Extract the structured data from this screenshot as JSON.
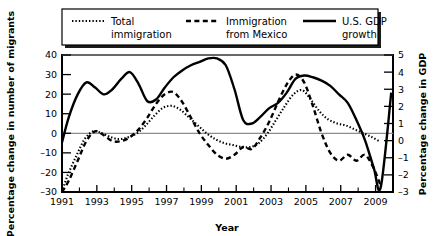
{
  "chart_data": {
    "type": "line",
    "title": "",
    "xlabel": "Year",
    "ylabel": "Percentage change in number of migrants",
    "y2label": "Percentage change in GDP",
    "ylim": [
      -30,
      40
    ],
    "y2lim": [
      -3,
      5
    ],
    "xlim": [
      1991,
      2010
    ],
    "grid": false,
    "zero_line": true,
    "legend_position": "top",
    "x_tick_labels": [
      "1991",
      "1993",
      "1995",
      "1997",
      "1999",
      "2001",
      "2003",
      "2005",
      "2007",
      "2009"
    ],
    "x_tick_values": [
      1991,
      1993,
      1995,
      1997,
      1999,
      2001,
      2003,
      2005,
      2007,
      2009
    ],
    "x_minor_ticks": [
      1992,
      1994,
      1996,
      1998,
      2000,
      2002,
      2004,
      2006,
      2008,
      2010
    ],
    "y_tick_labels": [
      "40",
      "30",
      "20",
      "10",
      "0",
      "-10",
      "-20",
      "-30"
    ],
    "y_tick_values": [
      40,
      30,
      20,
      10,
      0,
      -10,
      -20,
      -30
    ],
    "y2_tick_labels": [
      "5",
      "4",
      "3",
      "2",
      "1",
      "0",
      "-1",
      "-2",
      "-3"
    ],
    "y2_tick_values": [
      5,
      4,
      3,
      2,
      1,
      0,
      -1,
      -2,
      -3
    ],
    "series": [
      {
        "name": "Total immigration",
        "legend_label_line1": "Total",
        "legend_label_line2": "immigration",
        "style": "dotted",
        "axis": "left",
        "color": "#000000",
        "x": [
          1991.0,
          1991.3,
          1991.8,
          1992.3,
          1992.8,
          1993.3,
          1993.8,
          1994.3,
          1994.8,
          1995.3,
          1995.8,
          1996.3,
          1996.8,
          1997.3,
          1997.8,
          1998.3,
          1998.8,
          1999.3,
          1999.8,
          2000.3,
          2000.8,
          2001.3,
          2001.8,
          2002.3,
          2002.8,
          2003.3,
          2003.8,
          2004.3,
          2004.8,
          2005.3,
          2005.8,
          2006.3,
          2006.8,
          2007.3,
          2007.8,
          2008.3,
          2008.8,
          2009.2
        ],
        "values": [
          -30,
          -22,
          -12,
          -3,
          1,
          0,
          -2,
          -3,
          -2,
          0,
          4,
          9,
          13,
          14,
          12,
          8,
          4,
          0,
          -3,
          -5,
          -6,
          -7,
          -7,
          -5,
          0,
          7,
          14,
          20,
          22,
          17,
          11,
          7,
          5,
          4,
          2,
          0,
          -2,
          -4
        ]
      },
      {
        "name": "Immigration from Mexico",
        "legend_label_line1": "Immigration",
        "legend_label_line2": "from Mexico",
        "style": "dashed",
        "axis": "left",
        "color": "#000000",
        "x": [
          1991.0,
          1991.4,
          1991.9,
          1992.4,
          1992.9,
          1993.4,
          1993.9,
          1994.4,
          1994.9,
          1995.4,
          1995.9,
          1996.4,
          1996.9,
          1997.4,
          1997.9,
          1998.4,
          1998.9,
          1999.4,
          1999.9,
          2000.4,
          2000.9,
          2001.4,
          2001.9,
          2002.4,
          2002.9,
          2003.4,
          2003.9,
          2004.4,
          2004.9,
          2005.4,
          2005.9,
          2006.4,
          2006.9,
          2007.4,
          2007.9,
          2008.4,
          2008.9,
          2009.3
        ],
        "values": [
          -30,
          -24,
          -14,
          -4,
          1,
          -1,
          -4,
          -4,
          -2,
          2,
          8,
          15,
          20,
          21,
          16,
          8,
          0,
          -6,
          -11,
          -13,
          -11,
          -7,
          -8,
          -2,
          6,
          16,
          25,
          30,
          26,
          14,
          0,
          -10,
          -14,
          -11,
          -14,
          -11,
          -18,
          -27
        ]
      },
      {
        "name": "U.S. GDP growth",
        "legend_label_line1": "U.S. GDP",
        "legend_label_line2": "growth",
        "style": "solid",
        "axis": "right",
        "color": "#000000",
        "x": [
          1991.0,
          1991.4,
          1991.9,
          1992.4,
          1992.9,
          1993.4,
          1993.9,
          1994.4,
          1994.9,
          1995.4,
          1995.9,
          1996.4,
          1996.9,
          1997.4,
          1997.9,
          1998.4,
          1998.9,
          1999.4,
          1999.9,
          2000.4,
          2000.9,
          2001.4,
          2001.9,
          2002.4,
          2002.9,
          2003.4,
          2003.9,
          2004.4,
          2004.9,
          2005.4,
          2005.9,
          2006.4,
          2006.9,
          2007.4,
          2007.9,
          2008.4,
          2008.9,
          2009.3,
          2009.9
        ],
        "values": [
          -0.1,
          1.4,
          2.7,
          3.4,
          3.1,
          2.7,
          3.0,
          3.6,
          4.0,
          3.3,
          2.3,
          2.4,
          3.1,
          3.7,
          4.1,
          4.4,
          4.6,
          4.8,
          4.8,
          4.4,
          3.0,
          1.2,
          1.0,
          1.4,
          1.9,
          2.2,
          2.8,
          3.6,
          3.8,
          3.7,
          3.5,
          3.2,
          2.7,
          2.2,
          1.2,
          0.0,
          -1.6,
          -2.7,
          2.8
        ]
      }
    ]
  },
  "legend": {
    "items": [
      {
        "label_line1": "Total",
        "label_line2": "immigration",
        "style": "dotted"
      },
      {
        "label_line1": "Immigration",
        "label_line2": "from Mexico",
        "style": "dashed"
      },
      {
        "label_line1": "U.S. GDP",
        "label_line2": "growth",
        "style": "solid"
      }
    ]
  },
  "axes": {
    "x_title": "Year",
    "y_left_title": "Percentage change in number of migrants",
    "y_right_title": "Percentage change in GDP"
  }
}
